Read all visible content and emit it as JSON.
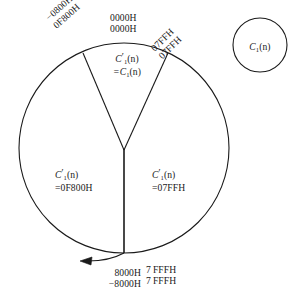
{
  "figure": {
    "kind": "number-circle-diagram",
    "stroke_color": "#1a1a1a",
    "background_color": "#ffffff",
    "main_circle": {
      "cx": 124,
      "cy": 148,
      "r": 105
    },
    "small_circle": {
      "cx": 260,
      "cy": 45,
      "r": 27
    },
    "labels": {
      "top_zero": {
        "line1": "0000H",
        "line2": "0000H"
      },
      "upper_left": {
        "line1": "−0800H",
        "line2": "0F800H"
      },
      "upper_right": {
        "line1": "07FFH",
        "line2": "07FFH"
      },
      "wedge": {
        "line1_c": "C",
        "line1_prime": "′",
        "line1_sub": "1",
        "line1_arg": "(n)",
        "line2_eq": "=C",
        "line2_sub": "1",
        "line2_arg": "(n)"
      },
      "left_sector": {
        "line1_c": "C",
        "line1_prime": "′",
        "line1_sub": "1",
        "line1_arg": "(n)",
        "line2": "=0F800H"
      },
      "right_sector": {
        "line1_c": "C",
        "line1_prime": "′",
        "line1_sub": "1",
        "line1_arg": "(n)",
        "line2": "=07FFH"
      },
      "bottom_left": {
        "line1": "8000H",
        "line2": "−8000H"
      },
      "bottom_right": {
        "line1": "7 FFFH",
        "line2": "7 FFFH"
      },
      "small_circle": {
        "c": "C",
        "sub": "1",
        "arg": "(n)"
      }
    }
  }
}
